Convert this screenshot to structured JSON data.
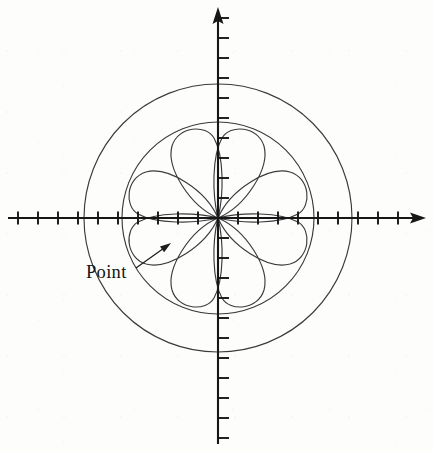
{
  "figure": {
    "background_color": "#fdfdfc",
    "axis_color": "#171718",
    "curve_color": "#3a3a3c"
  },
  "annotations": [
    {
      "id": "point-label",
      "label": "Point",
      "text_x": 86,
      "text_y": 278,
      "leader_from_x": 136,
      "leader_from_y": 268,
      "leader_to_x": 171,
      "leader_to_y": 243
    }
  ],
  "chart_data": {
    "type": "line",
    "title": "",
    "subtitle": "",
    "xlabel": "",
    "ylabel": "",
    "coordinate_system": "polar-on-cartesian-axes",
    "grid": false,
    "legend": null,
    "origin_px": {
      "x": 218,
      "y": 218
    },
    "pixels_per_unit": 20,
    "axes": {
      "x_axis": {
        "from_px": 8,
        "to_px": 426,
        "arrow": "right",
        "tick_spacing_units": 1,
        "tick_length_px": 13,
        "tick_positions_units": [
          -10,
          -9,
          -8,
          -7,
          -6,
          -5,
          -4,
          -3,
          -2,
          -1,
          1,
          2,
          3,
          4,
          5,
          6,
          7,
          8,
          9,
          10
        ],
        "range_units": [
          -10.5,
          10.4
        ],
        "tick_labels": []
      },
      "y_axis": {
        "from_px": 8,
        "to_px": 444,
        "arrow": "up",
        "tick_spacing_units": 1,
        "tick_length_px": 11,
        "tick_positions_units": [
          -11,
          -10,
          -9,
          -8,
          -7,
          -6,
          -5,
          -4,
          -3,
          -2,
          -1,
          1,
          2,
          3,
          4,
          5,
          6,
          7,
          8,
          9,
          10
        ],
        "range_units": [
          -11.3,
          10.5
        ],
        "tick_labels": []
      }
    },
    "series": [
      {
        "name": "four-petal rose",
        "equation": "r = a*cos(2*theta)",
        "amplitude_units": 4.8,
        "amplitude_px": 96,
        "petals": 4,
        "petal_tip_angles_deg": [
          0,
          90,
          180,
          270
        ],
        "petal_tips_units": [
          {
            "x": 4.8,
            "y": 0
          },
          {
            "x": 0,
            "y": 4.8
          },
          {
            "x": -4.8,
            "y": 0
          },
          {
            "x": 0,
            "y": -4.8
          }
        ],
        "stroke": "#3a3a3c"
      },
      {
        "name": "inner circle",
        "equation": "r = 4.8",
        "center_units": {
          "x": 0,
          "y": 0
        },
        "radius_units": 4.8,
        "radius_px": 96,
        "stroke": "#3a3a3c"
      },
      {
        "name": "outer circle",
        "equation": "r = 6.7",
        "center_units": {
          "x": 0,
          "y": 0
        },
        "radius_units": 6.7,
        "radius_px": 134,
        "stroke": "#3a3a3c"
      }
    ]
  }
}
